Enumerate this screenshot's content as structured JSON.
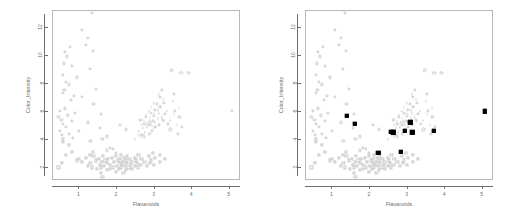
{
  "figure": {
    "title": "",
    "panels": [
      {
        "name": "left-panel",
        "highlight": false,
        "xlabel": "Flavanoids",
        "ylabel": "Color_Intensity"
      },
      {
        "name": "right-panel",
        "highlight": true,
        "xlabel": "Flavanoids",
        "ylabel": "Color_Intensity"
      }
    ]
  },
  "chart_data": {
    "type": "scatter",
    "title": "",
    "xlabel": "Flavanoids",
    "ylabel": "Color_Intensity",
    "xlim": [
      0.3,
      5.3
    ],
    "ylim": [
      1.1,
      13.2
    ],
    "xticks": [
      1,
      2,
      3,
      4,
      5
    ],
    "xticklabels": [
      "1",
      "2",
      "3",
      "4",
      "5"
    ],
    "yticks": [
      2,
      4,
      6,
      8,
      10,
      12
    ],
    "yticklabels": [
      "2",
      "4",
      "6",
      "8",
      "10",
      "12"
    ],
    "grid": false,
    "legend": null,
    "marker_color": "#c9c9c9",
    "highlight_color": "#000000",
    "highlight_marker": "filled-square",
    "series": [
      {
        "name": "class-1",
        "marker": "circle",
        "color": "#c9c9c9",
        "points": [
          [
            0.47,
            5.6
          ],
          [
            0.5,
            4.6
          ],
          [
            0.52,
            6.0
          ],
          [
            0.55,
            5.4
          ],
          [
            0.57,
            4.3
          ],
          [
            0.58,
            7.3
          ],
          [
            0.6,
            5.1
          ],
          [
            0.6,
            8.6
          ],
          [
            0.61,
            9.4
          ],
          [
            0.63,
            7.5
          ],
          [
            0.64,
            10.2
          ],
          [
            0.65,
            6.2
          ],
          [
            0.66,
            4.9
          ],
          [
            0.68,
            8.1
          ],
          [
            0.7,
            9.9
          ],
          [
            0.72,
            5.7
          ],
          [
            0.75,
            4.4
          ],
          [
            0.76,
            7.9
          ],
          [
            0.78,
            10.6
          ],
          [
            0.8,
            6.8
          ],
          [
            0.83,
            5.3
          ],
          [
            0.84,
            9.2
          ],
          [
            0.86,
            4.1
          ],
          [
            0.88,
            7.1
          ],
          [
            0.92,
            5.9
          ],
          [
            0.96,
            8.4
          ],
          [
            1.02,
            4.6
          ],
          [
            1.09,
            11.8
          ],
          [
            1.1,
            7.0
          ],
          [
            1.2,
            10.7
          ],
          [
            1.25,
            5.2
          ],
          [
            1.25,
            11.2
          ],
          [
            1.3,
            9.0
          ],
          [
            1.32,
            3.9
          ],
          [
            1.36,
            13.0
          ],
          [
            1.39,
            10.3
          ],
          [
            1.4,
            6.5
          ],
          [
            1.46,
            7.6
          ],
          [
            1.57,
            4.8
          ],
          [
            1.6,
            5.8
          ],
          [
            1.64,
            4.0
          ],
          [
            1.75,
            3.2
          ],
          [
            1.75,
            4.2
          ],
          [
            1.84,
            3.4
          ],
          [
            1.92,
            3.3
          ],
          [
            2.0,
            3.0
          ],
          [
            2.11,
            5.0
          ],
          [
            2.27,
            4.7
          ],
          [
            2.65,
            5.4
          ],
          [
            2.68,
            4.3
          ],
          [
            2.74,
            4.2
          ],
          [
            2.76,
            5.1
          ],
          [
            2.8,
            5.6
          ],
          [
            2.88,
            5.0
          ],
          [
            2.9,
            4.4
          ],
          [
            2.91,
            5.2
          ],
          [
            2.92,
            5.9
          ],
          [
            2.95,
            4.6
          ],
          [
            2.98,
            5.3
          ],
          [
            3.0,
            5.7
          ],
          [
            3.03,
            6.1
          ],
          [
            3.04,
            4.9
          ],
          [
            3.1,
            6.5
          ],
          [
            3.15,
            5.0
          ],
          [
            3.17,
            7.0
          ],
          [
            3.18,
            6.3
          ],
          [
            3.23,
            7.5
          ],
          [
            3.25,
            5.4
          ],
          [
            3.27,
            6.6
          ],
          [
            3.3,
            5.8
          ],
          [
            3.39,
            5.1
          ],
          [
            3.45,
            4.7
          ],
          [
            3.49,
            8.9
          ],
          [
            3.54,
            7.2
          ],
          [
            3.56,
            6.0
          ],
          [
            3.64,
            4.4
          ],
          [
            3.69,
            5.6
          ],
          [
            3.74,
            8.7
          ],
          [
            3.75,
            4.9
          ],
          [
            3.93,
            8.7
          ],
          [
            5.08,
            6.0
          ]
        ]
      },
      {
        "name": "class-2",
        "marker": "square",
        "color": "#c9c9c9",
        "points": [
          [
            0.47,
            2.0
          ],
          [
            0.57,
            2.3
          ],
          [
            0.58,
            4.0
          ],
          [
            0.6,
            3.8
          ],
          [
            0.66,
            2.9
          ],
          [
            0.75,
            3.6
          ],
          [
            0.84,
            3.1
          ],
          [
            0.96,
            2.5
          ],
          [
            1.02,
            2.6
          ],
          [
            1.1,
            2.4
          ],
          [
            1.2,
            2.7
          ],
          [
            1.25,
            2.1
          ],
          [
            1.3,
            2.9
          ],
          [
            1.32,
            2.3
          ],
          [
            1.36,
            2.0
          ],
          [
            1.39,
            3.1
          ],
          [
            1.4,
            2.8
          ],
          [
            1.46,
            2.5
          ],
          [
            1.5,
            1.9
          ],
          [
            1.55,
            2.6
          ],
          [
            1.57,
            2.2
          ],
          [
            1.6,
            1.6
          ],
          [
            1.6,
            2.0
          ],
          [
            1.63,
            2.4
          ],
          [
            1.64,
            1.3
          ],
          [
            1.66,
            2.8
          ],
          [
            1.69,
            2.1
          ],
          [
            1.72,
            2.5
          ],
          [
            1.75,
            1.8
          ],
          [
            1.76,
            2.3
          ],
          [
            1.79,
            2.6
          ],
          [
            1.84,
            1.9
          ],
          [
            1.85,
            2.2
          ],
          [
            1.9,
            2.7
          ],
          [
            1.92,
            2.0
          ],
          [
            1.95,
            2.4
          ],
          [
            2.0,
            1.7
          ],
          [
            2.01,
            2.8
          ],
          [
            2.03,
            2.1
          ],
          [
            2.05,
            2.5
          ],
          [
            2.08,
            1.9
          ],
          [
            2.1,
            2.3
          ],
          [
            2.11,
            2.6
          ],
          [
            2.13,
            2.0
          ],
          [
            2.14,
            2.9
          ],
          [
            2.17,
            2.2
          ],
          [
            2.19,
            2.4
          ],
          [
            2.2,
            1.6
          ],
          [
            2.21,
            2.7
          ],
          [
            2.24,
            2.1
          ],
          [
            2.26,
            2.5
          ],
          [
            2.27,
            1.8
          ],
          [
            2.29,
            2.3
          ],
          [
            2.3,
            2.8
          ],
          [
            2.33,
            2.0
          ],
          [
            2.36,
            2.6
          ],
          [
            2.4,
            2.2
          ],
          [
            2.41,
            2.4
          ],
          [
            2.43,
            1.9
          ],
          [
            2.5,
            2.7
          ],
          [
            2.51,
            2.1
          ],
          [
            2.53,
            2.5
          ],
          [
            2.55,
            2.3
          ],
          [
            2.58,
            2.0
          ],
          [
            2.6,
            2.9
          ],
          [
            2.65,
            2.2
          ],
          [
            2.68,
            2.6
          ],
          [
            2.76,
            2.4
          ],
          [
            2.83,
            2.1
          ],
          [
            2.88,
            2.8
          ],
          [
            2.9,
            2.3
          ],
          [
            2.92,
            2.5
          ],
          [
            2.98,
            3.0
          ],
          [
            3.0,
            2.2
          ],
          [
            3.03,
            2.7
          ],
          [
            3.17,
            2.4
          ],
          [
            3.18,
            2.9
          ],
          [
            3.3,
            2.6
          ]
        ]
      },
      {
        "name": "class-3",
        "marker": "triangle",
        "color": "#c9c9c9",
        "points": [
          [
            2.53,
            4.0
          ],
          [
            2.6,
            4.3
          ],
          [
            2.65,
            4.6
          ],
          [
            2.68,
            5.0
          ],
          [
            2.7,
            4.2
          ],
          [
            2.74,
            4.8
          ],
          [
            2.76,
            5.3
          ],
          [
            2.8,
            4.5
          ],
          [
            2.83,
            5.7
          ],
          [
            2.86,
            4.9
          ],
          [
            2.88,
            5.2
          ],
          [
            2.9,
            6.0
          ],
          [
            2.91,
            4.4
          ],
          [
            2.92,
            5.5
          ],
          [
            2.95,
            6.3
          ],
          [
            2.98,
            5.0
          ],
          [
            3.0,
            4.7
          ],
          [
            3.03,
            5.8
          ],
          [
            3.04,
            6.6
          ],
          [
            3.06,
            5.2
          ],
          [
            3.1,
            4.9
          ],
          [
            3.14,
            6.1
          ],
          [
            3.15,
            5.5
          ],
          [
            3.17,
            7.2
          ],
          [
            3.18,
            5.9
          ],
          [
            3.2,
            5.1
          ],
          [
            3.23,
            6.4
          ],
          [
            3.25,
            5.6
          ],
          [
            3.27,
            6.9
          ],
          [
            3.3,
            5.3
          ],
          [
            3.39,
            6.0
          ],
          [
            3.45,
            5.4
          ],
          [
            3.49,
            8.9
          ],
          [
            3.54,
            6.7
          ],
          [
            3.56,
            5.8
          ],
          [
            3.64,
            5.0
          ],
          [
            3.69,
            6.2
          ],
          [
            3.74,
            8.7
          ],
          [
            3.93,
            8.7
          ]
        ]
      }
    ],
    "highlight_points": [
      [
        1.41,
        5.65
      ],
      [
        1.62,
        5.1
      ],
      [
        2.25,
        3.05
      ],
      [
        2.6,
        4.55
      ],
      [
        2.65,
        4.5
      ],
      [
        2.85,
        3.1
      ],
      [
        2.95,
        4.6
      ],
      [
        3.1,
        5.2
      ],
      [
        3.15,
        4.5
      ],
      [
        3.72,
        4.6
      ],
      [
        5.08,
        6.0
      ]
    ]
  }
}
